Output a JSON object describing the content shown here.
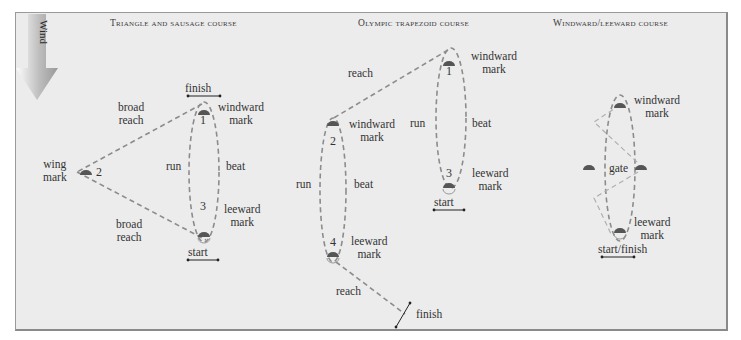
{
  "legend": {
    "wind_label": "Wind",
    "wind_direction": "down"
  },
  "colors": {
    "background": "#ececec",
    "course_line": "#8c8c8c",
    "mark": "#555555",
    "arrow": "#9a9a9a",
    "text": "#333333"
  },
  "courses": [
    {
      "title": "Triangle and sausage course",
      "labels": {
        "finish": "finish",
        "start": "start",
        "windward_mark": [
          "windward",
          "mark"
        ],
        "leeward_mark": [
          "leeward",
          "mark"
        ],
        "wing_mark": [
          "wing",
          "mark"
        ],
        "broad_reach_top": [
          "broad",
          "reach"
        ],
        "broad_reach_bottom": [
          "broad",
          "reach"
        ],
        "run": "run",
        "beat": "beat"
      },
      "mark_numbers": [
        "1",
        "2",
        "3"
      ]
    },
    {
      "title": "Olympic trapezoid course",
      "labels": {
        "reach_top": "reach",
        "reach_bottom": "reach",
        "windward_mark_1": [
          "windward",
          "mark"
        ],
        "windward_mark_2": [
          "windward",
          "mark"
        ],
        "leeward_mark_3": [
          "leeward",
          "mark"
        ],
        "leeward_mark_4": [
          "leeward",
          "mark"
        ],
        "run_inner": "run",
        "run_outer": "run",
        "beat_inner": "beat",
        "beat_outer": "beat",
        "start": "start",
        "finish": "finish"
      },
      "mark_numbers": [
        "1",
        "2",
        "3",
        "4"
      ]
    },
    {
      "title": "Windward/leeward course",
      "labels": {
        "windward_mark": [
          "windward",
          "mark"
        ],
        "leeward_mark": [
          "leeward",
          "mark"
        ],
        "gate": "gate",
        "start_finish": "start/finish"
      }
    }
  ]
}
